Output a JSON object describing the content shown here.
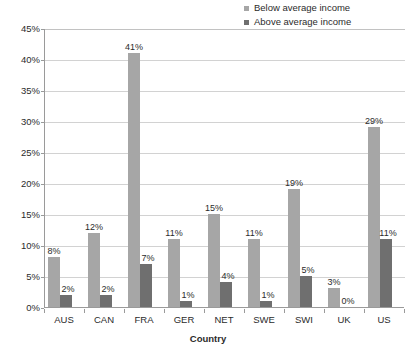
{
  "chart_data": {
    "type": "bar",
    "title": "",
    "xlabel": "Country",
    "ylabel": "Percent",
    "categories": [
      "AUS",
      "CAN",
      "FRA",
      "GER",
      "NET",
      "SWE",
      "SWI",
      "UK",
      "US"
    ],
    "series": [
      {
        "name": "Below average income",
        "color": "#a6a6a6",
        "values": [
          8,
          12,
          41,
          11,
          15,
          11,
          19,
          3,
          29
        ],
        "labels": [
          "8%",
          "12%",
          "41%",
          "11%",
          "15%",
          "11%",
          "19%",
          "3%",
          "29%"
        ]
      },
      {
        "name": "Above average income",
        "color": "#6f6f6f",
        "values": [
          2,
          2,
          7,
          1,
          4,
          1,
          5,
          0,
          11
        ],
        "labels": [
          "2%",
          "2%",
          "7%",
          "1%",
          "4%",
          "1%",
          "5%",
          "0%",
          "11%"
        ]
      }
    ],
    "ylim": [
      0,
      45
    ],
    "ytick_values": [
      0,
      5,
      10,
      15,
      20,
      25,
      30,
      35,
      40,
      45
    ],
    "ytick_labels": [
      "0%",
      "5%",
      "10%",
      "15%",
      "20%",
      "25%",
      "30%",
      "35%",
      "40%",
      "45%"
    ],
    "grid": true,
    "legend_position": "top-right"
  },
  "legend": {
    "items": [
      {
        "label": "Below average income",
        "color": "#a6a6a6"
      },
      {
        "label": "Above average income",
        "color": "#6f6f6f"
      }
    ]
  },
  "axes": {
    "y_title": "Percent",
    "x_title": "Country"
  },
  "colors": {
    "below_average": "#a6a6a6",
    "above_average": "#6f6f6f",
    "gridline": "#d2d2d2",
    "axis": "#9a9a9a",
    "text": "#2b2b2b",
    "background": "#ffffff"
  }
}
